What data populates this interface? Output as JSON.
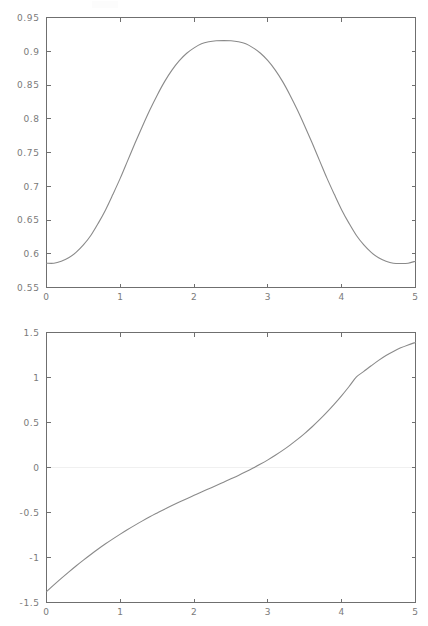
{
  "figure": {
    "background_color": "#ffffff",
    "axis_color": "#6f6f6f",
    "curve_color": "#8a8a8a",
    "tick_label_color": "#7a7a7a",
    "zero_line_color": "#f0f0f0"
  },
  "chart_data": [
    {
      "type": "line",
      "id": "top-plot",
      "title": "",
      "xlabel": "",
      "ylabel": "",
      "xlim": [
        0,
        5
      ],
      "ylim": [
        0.55,
        0.95
      ],
      "grid": false,
      "legend": null,
      "xticks": [
        0,
        1,
        2,
        3,
        4,
        5
      ],
      "xticklabels": [
        "0",
        "1",
        "2",
        "3",
        "4",
        "5"
      ],
      "yticks": [
        0.55,
        0.6,
        0.65,
        0.7,
        0.75,
        0.8,
        0.85,
        0.9,
        0.95
      ],
      "yticklabels": [
        "0.55",
        "0.6",
        "0.65",
        "0.7",
        "0.75",
        "0.8",
        "0.85",
        "0.9",
        "0.95"
      ],
      "series": [
        {
          "name": "curve-1",
          "x": [
            0.0,
            0.1,
            0.2,
            0.3,
            0.4,
            0.5,
            0.6,
            0.7,
            0.8,
            0.9,
            1.0,
            1.1,
            1.2,
            1.3,
            1.4,
            1.5,
            1.6,
            1.7,
            1.8,
            1.9,
            2.0,
            2.1,
            2.2,
            2.3,
            2.4,
            2.5,
            2.6,
            2.7,
            2.8,
            2.9,
            3.0,
            3.1,
            3.2,
            3.3,
            3.4,
            3.5,
            3.6,
            3.7,
            3.8,
            3.9,
            4.0,
            4.1,
            4.2,
            4.3,
            4.4,
            4.5,
            4.6,
            4.7,
            4.8,
            4.9,
            5.0
          ],
          "y": [
            0.586,
            0.586,
            0.589,
            0.594,
            0.602,
            0.613,
            0.627,
            0.645,
            0.665,
            0.688,
            0.712,
            0.738,
            0.764,
            0.789,
            0.813,
            0.835,
            0.855,
            0.872,
            0.886,
            0.897,
            0.905,
            0.911,
            0.914,
            0.9155,
            0.9158,
            0.9155,
            0.914,
            0.911,
            0.905,
            0.897,
            0.886,
            0.872,
            0.855,
            0.835,
            0.813,
            0.789,
            0.764,
            0.738,
            0.712,
            0.688,
            0.665,
            0.645,
            0.627,
            0.613,
            0.602,
            0.594,
            0.589,
            0.586,
            0.5855,
            0.586,
            0.589
          ]
        }
      ],
      "annotations": {
        "peak_x": 2.5,
        "peak_y": 0.9158,
        "start_y": 0.586,
        "end_y": 0.589
      }
    },
    {
      "type": "line",
      "id": "bottom-plot",
      "title": "",
      "xlabel": "",
      "ylabel": "",
      "xlim": [
        0,
        5
      ],
      "ylim": [
        -1.5,
        1.5
      ],
      "grid": false,
      "legend": null,
      "zero_line": true,
      "xticks": [
        0,
        1,
        2,
        3,
        4,
        5
      ],
      "xticklabels": [
        "0",
        "1",
        "2",
        "3",
        "4",
        "5"
      ],
      "yticks": [
        -1.5,
        -1,
        -0.5,
        0,
        0.5,
        1,
        1.5
      ],
      "yticklabels": [
        "-1.5",
        "-1",
        "-0.5",
        "0",
        "0.5",
        "1",
        "1.5"
      ],
      "series": [
        {
          "name": "curve-2",
          "x": [
            0.0,
            0.1,
            0.2,
            0.3,
            0.4,
            0.5,
            0.6,
            0.7,
            0.8,
            0.9,
            1.0,
            1.1,
            1.2,
            1.3,
            1.4,
            1.5,
            1.6,
            1.7,
            1.8,
            1.9,
            2.0,
            2.1,
            2.2,
            2.3,
            2.4,
            2.5,
            2.6,
            2.7,
            2.8,
            2.9,
            3.0,
            3.1,
            3.2,
            3.3,
            3.4,
            3.5,
            3.6,
            3.7,
            3.8,
            3.9,
            4.0,
            4.1,
            4.2,
            4.3,
            4.4,
            4.5,
            4.6,
            4.7,
            4.8,
            4.9,
            5.0
          ],
          "y": [
            -1.38,
            -1.305,
            -1.232,
            -1.162,
            -1.094,
            -1.029,
            -0.966,
            -0.906,
            -0.848,
            -0.793,
            -0.74,
            -0.689,
            -0.64,
            -0.593,
            -0.548,
            -0.505,
            -0.463,
            -0.423,
            -0.384,
            -0.346,
            -0.309,
            -0.272,
            -0.236,
            -0.2,
            -0.163,
            -0.126,
            -0.088,
            -0.048,
            -0.006,
            0.038,
            0.085,
            0.136,
            0.19,
            0.249,
            0.312,
            0.38,
            0.453,
            0.531,
            0.615,
            0.704,
            0.799,
            0.9,
            1.006,
            1.068,
            1.13,
            1.19,
            1.245,
            1.29,
            1.33,
            1.362,
            1.39
          ]
        }
      ],
      "annotations": {
        "zero_crossing_x": 2.81,
        "start_y": -1.38,
        "end_y": 1.39
      }
    }
  ]
}
